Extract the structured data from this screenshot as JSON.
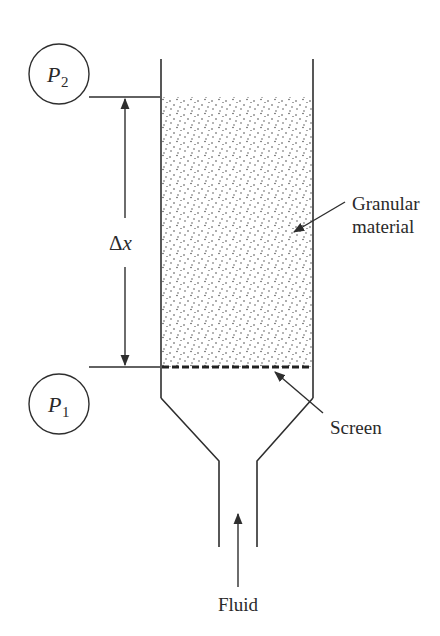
{
  "diagram": {
    "type": "packed-bed flow apparatus",
    "pressure_gauges": [
      {
        "id": "p2",
        "symbol": "P",
        "subscript": "2",
        "position": "top"
      },
      {
        "id": "p1",
        "symbol": "P",
        "subscript": "1",
        "position": "bottom"
      }
    ],
    "dimension": {
      "label_delta": "Δ",
      "label_var": "x"
    },
    "labels": {
      "granular_line1": "Granular",
      "granular_line2": "material",
      "screen": "Screen",
      "fluid": "Fluid"
    },
    "colors": {
      "line": "#2e2e2e",
      "text": "#2a2a2a",
      "background": "#ffffff"
    }
  }
}
